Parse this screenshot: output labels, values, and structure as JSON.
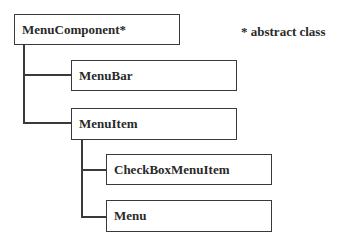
{
  "diagram": {
    "type": "class hierarchy",
    "note": "* abstract class",
    "nodes": [
      {
        "id": "menucomponent",
        "label": "MenuComponent*",
        "parent": null
      },
      {
        "id": "menubar",
        "label": "MenuBar",
        "parent": "menucomponent"
      },
      {
        "id": "menuitem",
        "label": "MenuItem",
        "parent": "menucomponent"
      },
      {
        "id": "checkboxmenuitem",
        "label": "CheckBoxMenuItem",
        "parent": "menuitem"
      },
      {
        "id": "menu",
        "label": "Menu",
        "parent": "menuitem"
      }
    ]
  }
}
